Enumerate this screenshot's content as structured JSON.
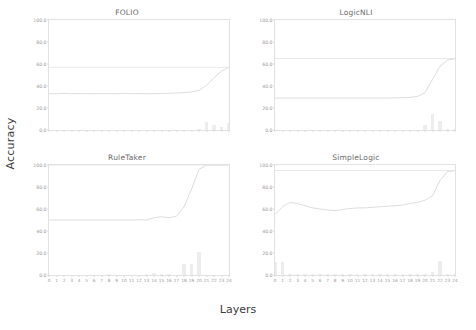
{
  "figure": {
    "xlabel": "Layers",
    "ylabel": "Accuracy"
  },
  "chart_data": [
    {
      "type": "line",
      "title": "FOLIO",
      "xlabel": "Layers",
      "ylabel": "Accuracy",
      "xlim": [
        0,
        24
      ],
      "ylim": [
        0,
        100
      ],
      "yticks": [
        "0.0",
        "20.0",
        "40.0",
        "60.0",
        "80.0",
        "100.0"
      ],
      "ytick_values": [
        0,
        20,
        40,
        60,
        80,
        100
      ],
      "xticks": [
        "0",
        "1",
        "2",
        "3",
        "4",
        "5",
        "6",
        "7",
        "8",
        "9",
        "10",
        "11",
        "12",
        "13",
        "14",
        "15",
        "16",
        "17",
        "18",
        "19",
        "20",
        "21",
        "22",
        "23",
        "24"
      ],
      "xtick_labels_visible": false,
      "grid": false,
      "reference_line": {
        "label": "full-model accuracy",
        "value": 57.0
      },
      "series": [
        {
          "name": "probe accuracy",
          "x": [
            0,
            1,
            2,
            3,
            4,
            5,
            6,
            7,
            8,
            9,
            10,
            11,
            12,
            13,
            14,
            15,
            16,
            17,
            18,
            19,
            20,
            21,
            22,
            23,
            24
          ],
          "values": [
            33.0,
            33.0,
            33.2,
            33.0,
            33.1,
            33.0,
            33.0,
            33.1,
            33.0,
            33.0,
            33.2,
            33.0,
            33.1,
            33.0,
            33.0,
            33.2,
            33.4,
            33.6,
            34.0,
            34.6,
            36.0,
            40.5,
            47.5,
            53.5,
            57.0
          ]
        }
      ],
      "bars": {
        "name": "layer contribution",
        "x": [
          0,
          1,
          2,
          3,
          4,
          5,
          6,
          7,
          8,
          9,
          10,
          11,
          12,
          13,
          14,
          15,
          16,
          17,
          18,
          19,
          20,
          21,
          22,
          23,
          24
        ],
        "values": [
          0,
          0,
          0,
          0,
          0,
          0,
          0,
          0,
          0,
          0,
          0,
          0,
          0,
          0,
          0,
          0,
          0,
          0,
          0,
          0,
          0.4,
          7.5,
          4.8,
          3.0,
          6.0
        ]
      }
    },
    {
      "type": "line",
      "title": "LogicNLI",
      "xlabel": "Layers",
      "ylabel": "Accuracy",
      "xlim": [
        0,
        24
      ],
      "ylim": [
        0,
        100
      ],
      "yticks": [
        "0.0",
        "20.0",
        "40.0",
        "60.0",
        "80.0",
        "100.0"
      ],
      "ytick_values": [
        0,
        20,
        40,
        60,
        80,
        100
      ],
      "xticks": [
        "0",
        "1",
        "2",
        "3",
        "4",
        "5",
        "6",
        "7",
        "8",
        "9",
        "10",
        "11",
        "12",
        "13",
        "14",
        "15",
        "16",
        "17",
        "18",
        "19",
        "20",
        "21",
        "22",
        "23",
        "24"
      ],
      "xtick_labels_visible": false,
      "grid": false,
      "reference_line": {
        "label": "full-model accuracy",
        "value": 65.0
      },
      "series": [
        {
          "name": "probe accuracy",
          "x": [
            0,
            1,
            2,
            3,
            4,
            5,
            6,
            7,
            8,
            9,
            10,
            11,
            12,
            13,
            14,
            15,
            16,
            17,
            18,
            19,
            20,
            21,
            22,
            23,
            24
          ],
          "values": [
            29.0,
            29.0,
            29.0,
            29.0,
            29.0,
            29.0,
            29.0,
            29.0,
            29.0,
            29.0,
            29.0,
            29.0,
            29.0,
            29.0,
            29.0,
            29.0,
            29.2,
            29.4,
            29.6,
            30.5,
            34.0,
            46.0,
            58.0,
            63.5,
            65.0
          ]
        }
      ],
      "bars": {
        "name": "layer contribution",
        "x": [
          0,
          1,
          2,
          3,
          4,
          5,
          6,
          7,
          8,
          9,
          10,
          11,
          12,
          13,
          14,
          15,
          16,
          17,
          18,
          19,
          20,
          21,
          22,
          23,
          24
        ],
        "values": [
          0,
          0,
          0,
          0,
          0,
          0,
          0,
          0,
          0,
          0,
          0,
          0,
          0,
          0,
          0,
          0,
          0,
          0,
          0,
          0,
          4.5,
          14.5,
          8.0,
          1.0,
          0.5
        ]
      }
    },
    {
      "type": "line",
      "title": "RuleTaker",
      "xlabel": "Layers",
      "ylabel": "Accuracy",
      "xlim": [
        0,
        24
      ],
      "ylim": [
        0,
        100
      ],
      "yticks": [
        "0.0",
        "20.0",
        "40.0",
        "60.0",
        "80.0",
        "100.0"
      ],
      "ytick_values": [
        0,
        20,
        40,
        60,
        80,
        100
      ],
      "xticks": [
        "0",
        "1",
        "2",
        "3",
        "4",
        "5",
        "6",
        "7",
        "8",
        "9",
        "10",
        "11",
        "12",
        "13",
        "14",
        "15",
        "16",
        "17",
        "18",
        "19",
        "20",
        "21",
        "22",
        "23",
        "24"
      ],
      "xtick_labels_visible": true,
      "grid": false,
      "reference_line": {
        "label": "full-model accuracy",
        "value": 100.0
      },
      "series": [
        {
          "name": "probe accuracy",
          "x": [
            0,
            1,
            2,
            3,
            4,
            5,
            6,
            7,
            8,
            9,
            10,
            11,
            12,
            13,
            14,
            15,
            16,
            17,
            18,
            19,
            20,
            21,
            22,
            23,
            24
          ],
          "values": [
            50.0,
            50.0,
            50.0,
            50.0,
            50.0,
            50.0,
            50.0,
            50.0,
            50.0,
            50.0,
            50.0,
            50.0,
            50.2,
            50.0,
            52.0,
            53.0,
            52.0,
            53.5,
            62.0,
            78.0,
            96.0,
            100.0,
            100.0,
            100.0,
            100.0
          ]
        }
      ],
      "bars": {
        "name": "layer contribution",
        "x": [
          0,
          1,
          2,
          3,
          4,
          5,
          6,
          7,
          8,
          9,
          10,
          11,
          12,
          13,
          14,
          15,
          16,
          17,
          18,
          19,
          20,
          21,
          22,
          23,
          24
        ],
        "values": [
          0,
          0,
          0,
          0,
          0,
          0,
          0,
          0,
          0.3,
          0,
          0,
          0,
          0,
          0.6,
          1.5,
          0.4,
          1.0,
          0,
          10.0,
          10.0,
          21.0,
          0,
          0,
          0,
          0
        ]
      }
    },
    {
      "type": "line",
      "title": "SimpleLogic",
      "xlabel": "Layers",
      "ylabel": "Accuracy",
      "xlim": [
        0,
        24
      ],
      "ylim": [
        0,
        100
      ],
      "yticks": [
        "0.0",
        "20.0",
        "40.0",
        "60.0",
        "80.0",
        "100.0"
      ],
      "ytick_values": [
        0,
        20,
        40,
        60,
        80,
        100
      ],
      "xticks": [
        "0",
        "1",
        "2",
        "3",
        "4",
        "5",
        "6",
        "7",
        "8",
        "9",
        "10",
        "11",
        "12",
        "13",
        "14",
        "15",
        "16",
        "17",
        "18",
        "19",
        "20",
        "21",
        "22",
        "23",
        "24"
      ],
      "xtick_labels_visible": true,
      "grid": false,
      "reference_line": {
        "label": "full-model accuracy",
        "value": 95.0
      },
      "series": [
        {
          "name": "probe accuracy",
          "x": [
            0,
            1,
            2,
            3,
            4,
            5,
            6,
            7,
            8,
            9,
            10,
            11,
            12,
            13,
            14,
            15,
            16,
            17,
            18,
            19,
            20,
            21,
            22,
            23,
            24
          ],
          "values": [
            55.0,
            62.0,
            66.0,
            65.0,
            63.0,
            61.0,
            60.0,
            59.0,
            58.5,
            59.5,
            60.5,
            61.0,
            61.0,
            61.5,
            62.0,
            62.5,
            63.0,
            63.5,
            65.0,
            66.0,
            68.0,
            72.0,
            86.0,
            94.0,
            95.0
          ]
        }
      ],
      "bars": {
        "name": "layer contribution",
        "x": [
          0,
          1,
          2,
          3,
          4,
          5,
          6,
          7,
          8,
          9,
          10,
          11,
          12,
          13,
          14,
          15,
          16,
          17,
          18,
          19,
          20,
          21,
          22,
          23,
          24
        ],
        "values": [
          12.0,
          11.5,
          0.5,
          0.5,
          0.3,
          0.2,
          0.8,
          0.8,
          0.5,
          0.5,
          0.5,
          0.5,
          0.4,
          0.3,
          0.3,
          0.2,
          1.0,
          0.6,
          0.5,
          1.2,
          1.2,
          3.0,
          13.0,
          0.6,
          0.3
        ]
      }
    }
  ],
  "colors": {
    "line": "#d9d9d9",
    "reference_line": "#e6e6e6",
    "bar": "#ededed",
    "axis": "#e2e2e2",
    "tick_text": "#9a9a9a",
    "title_text": "#6a6a6a",
    "label_text": "#3b3b3b"
  }
}
